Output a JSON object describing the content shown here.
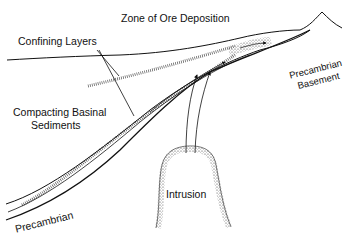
{
  "diagram": {
    "labels": {
      "zone": "Zone of Ore Deposition",
      "confining": "Confining Layers",
      "compacting_line1": "Compacting Basinal",
      "compacting_line2": "Sediments",
      "basement_line1": "Precambrian",
      "basement_line2": "Basement",
      "intrusion": "Intrusion",
      "precambrian": "Precambrian"
    },
    "colors": {
      "line": "#111111",
      "background": "#ffffff",
      "stipple": "#555555"
    }
  }
}
